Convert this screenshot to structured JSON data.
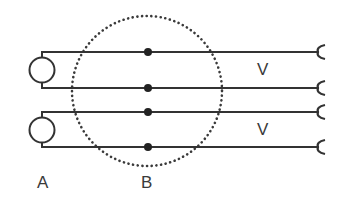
{
  "diagram": {
    "labels": {
      "a": "A",
      "b": "B",
      "v_top": "V",
      "v_bottom": "V"
    },
    "colors": {
      "line": "#333333",
      "dotted_circle": "#3a3a3a",
      "node": "#222222",
      "text": "#3a3a3a",
      "background": "#ffffff"
    },
    "sources": [
      {
        "id": "source-1",
        "shape": "circle",
        "wires": [
          1,
          2
        ]
      },
      {
        "id": "source-2",
        "shape": "circle",
        "wires": [
          3,
          4
        ]
      }
    ],
    "wires": [
      {
        "id": 1,
        "junction_node": true,
        "end": "cup-connector"
      },
      {
        "id": 2,
        "junction_node": true,
        "end": "cup-connector"
      },
      {
        "id": 3,
        "junction_node": true,
        "end": "cup-connector"
      },
      {
        "id": 4,
        "junction_node": true,
        "end": "cup-connector"
      }
    ],
    "region_b": {
      "shape": "dotted-circle"
    }
  }
}
